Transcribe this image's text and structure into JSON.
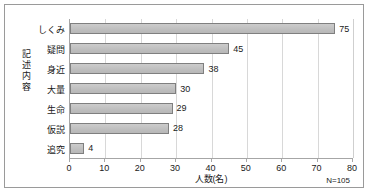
{
  "chart_data": {
    "type": "bar",
    "orientation": "horizontal",
    "title": "",
    "categories": [
      "しくみ",
      "疑問",
      "身近",
      "大量",
      "生命",
      "仮説",
      "追究"
    ],
    "values": [
      75,
      45,
      38,
      30,
      29,
      28,
      4
    ],
    "value_labels": [
      "75",
      "45",
      "38",
      "30",
      "29",
      "28",
      "4"
    ],
    "xlabel": "人数(名)",
    "ylabel": "記述内容",
    "xlim": [
      0,
      80
    ],
    "xticks": [
      0,
      10,
      20,
      30,
      40,
      50,
      60,
      70,
      80
    ],
    "xtick_labels": [
      "0",
      "10",
      "20",
      "30",
      "40",
      "50",
      "60",
      "70",
      "80"
    ],
    "grid": "vertical",
    "legend": "none",
    "annotation": "N=105",
    "bar_fill_color": "#bfbfbf",
    "bar_border_color": "#7f7f7f",
    "axis_color": "#a6a6a6",
    "gridline_color": "#d8d8d8",
    "text_color": "#1a1a1a",
    "frame_color": "#9a9a9a"
  }
}
